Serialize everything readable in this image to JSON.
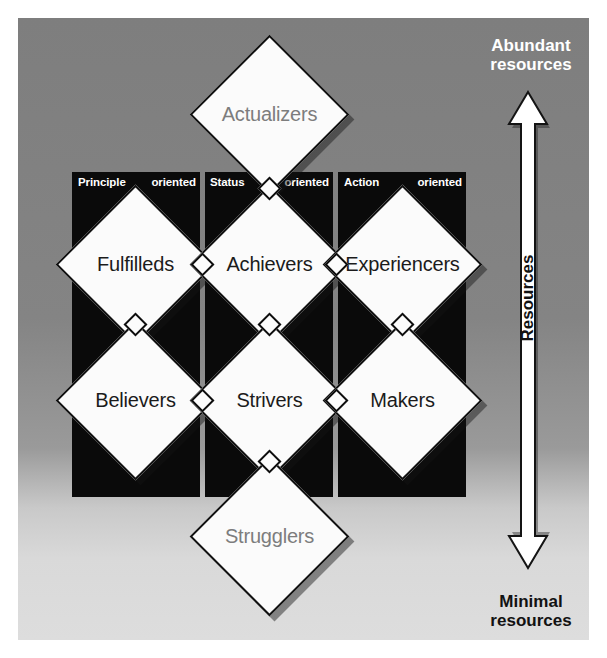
{
  "diagram": {
    "columns": [
      {
        "lead": "Principle",
        "tail": "oriented"
      },
      {
        "lead": "Status",
        "tail": "oriented"
      },
      {
        "lead": "Action",
        "tail": "oriented"
      }
    ],
    "top_segment": {
      "label": "Actualizers"
    },
    "bottom_segment": {
      "label": "Strugglers"
    },
    "grid": [
      [
        {
          "label": "Fulfilleds"
        },
        {
          "label": "Achievers"
        },
        {
          "label": "Experiencers"
        }
      ],
      [
        {
          "label": "Believers"
        },
        {
          "label": "Strivers"
        },
        {
          "label": "Makers"
        }
      ]
    ],
    "axis": {
      "top_label": "Abundant\nresources",
      "top_label_line1": "Abundant",
      "top_label_line2": "resources",
      "bottom_label_line1": "Minimal",
      "bottom_label_line2": "resources",
      "middle_label": "Resources"
    },
    "colors": {
      "panel": "#0a0a0a",
      "diamond_fill": "#fbfbfb",
      "diamond_stroke": "#111111",
      "muted_text": "#7d7d7d",
      "dark_text": "#1b1b1b",
      "arrow_fill": "#ffffff",
      "backdrop_top": "#7e7e7e",
      "backdrop_bottom": "#dddddd"
    }
  }
}
